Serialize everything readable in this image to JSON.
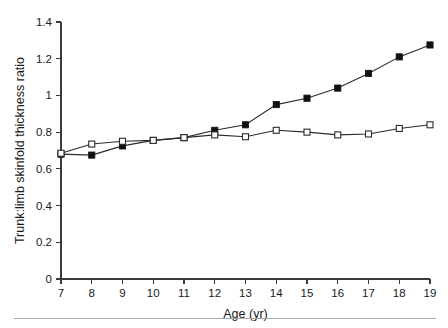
{
  "chart_data": {
    "type": "line",
    "title": "",
    "xlabel": "Age (yr)",
    "ylabel": "Trunk:limb skinfold thickness ratio",
    "x": [
      7,
      8,
      9,
      10,
      11,
      12,
      13,
      14,
      15,
      16,
      17,
      18,
      19
    ],
    "xtick_labels": [
      "7",
      "8",
      "9",
      "10",
      "11",
      "12",
      "13",
      "14",
      "15",
      "16",
      "17",
      "18",
      "19"
    ],
    "ytick_labels": [
      "0",
      "0.2",
      "0.4",
      "0.6",
      "0.8",
      "1",
      "1.2",
      "1.4"
    ],
    "ytick_values": [
      0,
      0.2,
      0.4,
      0.6,
      0.8,
      1.0,
      1.2,
      1.4
    ],
    "xlim": [
      7,
      19
    ],
    "ylim": [
      0,
      1.4
    ],
    "grid": false,
    "legend": "none",
    "series": [
      {
        "name": "filled-squares",
        "marker": "filled-square",
        "color": "#111111",
        "values": [
          0.68,
          0.675,
          0.725,
          0.755,
          0.77,
          0.81,
          0.84,
          0.95,
          0.985,
          1.04,
          1.12,
          1.21,
          1.275
        ]
      },
      {
        "name": "open-squares",
        "marker": "open-square",
        "color": "#2b2b2b",
        "values": [
          0.685,
          0.735,
          0.75,
          0.755,
          0.77,
          0.785,
          0.775,
          0.81,
          0.8,
          0.785,
          0.79,
          0.82,
          0.84
        ]
      }
    ]
  },
  "figure": {
    "axis_color": "#3a3a3a",
    "footer_rule_color": "#a8a8a8",
    "background": "#ffffff"
  }
}
